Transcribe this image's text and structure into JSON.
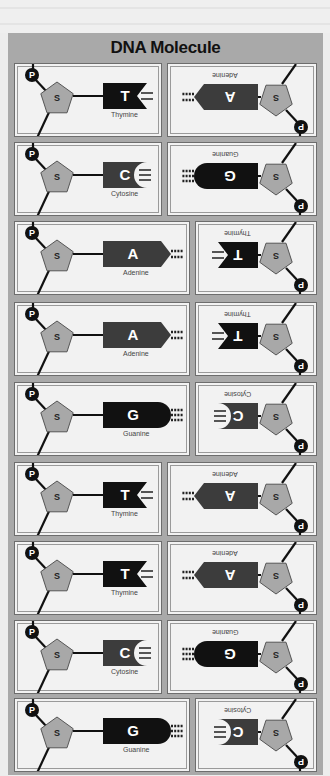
{
  "title": "DNA Molecule",
  "labels": {
    "sugar": "S",
    "phosphate": "P"
  },
  "colors": {
    "frame": "#a9a9a9",
    "panel": "#f2f2f2",
    "sugar": "#a8a8a8",
    "dark_base": "#111111",
    "gray_base": "#3c3c3c"
  },
  "bases": {
    "T": {
      "letter": "T",
      "name": "Thymine"
    },
    "A": {
      "letter": "A",
      "name": "Adenine"
    },
    "C": {
      "letter": "C",
      "name": "Cytosine"
    },
    "G": {
      "letter": "G",
      "name": "Guanine"
    }
  },
  "pairs": [
    {
      "left": "T",
      "right": "A"
    },
    {
      "left": "C",
      "right": "G"
    },
    {
      "left": "A",
      "right": "T"
    },
    {
      "left": "A",
      "right": "T"
    },
    {
      "left": "G",
      "right": "C"
    },
    {
      "left": "T",
      "right": "A"
    },
    {
      "left": "T",
      "right": "A"
    },
    {
      "left": "C",
      "right": "G"
    },
    {
      "left": "G",
      "right": "C"
    }
  ]
}
